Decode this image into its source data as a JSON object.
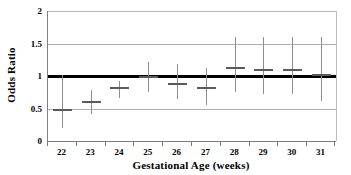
{
  "chart_data": {
    "type": "scatter",
    "title": "",
    "xlabel": "Gestational Age (weeks)",
    "ylabel": "Odds Ratio",
    "categories": [
      "22",
      "23",
      "24",
      "25",
      "26",
      "27",
      "28",
      "29",
      "30",
      "31"
    ],
    "x": [
      22,
      23,
      24,
      25,
      26,
      27,
      28,
      29,
      30,
      31
    ],
    "values": [
      0.48,
      0.6,
      0.81,
      0.98,
      0.88,
      0.82,
      1.12,
      1.09,
      1.09,
      1.01
    ],
    "ci_lower": [
      0.2,
      0.42,
      0.66,
      0.75,
      0.65,
      0.55,
      0.75,
      0.72,
      0.72,
      0.62
    ],
    "ci_upper": [
      1.01,
      0.78,
      0.93,
      1.22,
      1.18,
      1.12,
      1.6,
      1.6,
      1.6,
      1.6
    ],
    "series": [
      {
        "name": "Odds Ratio",
        "values": [
          0.48,
          0.6,
          0.81,
          0.98,
          0.88,
          0.82,
          1.12,
          1.09,
          1.09,
          1.01
        ]
      }
    ],
    "reference_line": 1.0,
    "ylim": [
      0,
      2
    ],
    "yticks": [
      0,
      0.5,
      1,
      1.5,
      2
    ],
    "ytick_labels": [
      "0",
      "0.5",
      "1",
      "1.5",
      "2"
    ],
    "grid": true,
    "grid_axis": "y",
    "legend": false,
    "legend_position": "none",
    "colors": {
      "marker": "#5a5a5a",
      "whisker": "#8d8d8d",
      "gridline": "#b0b0b0",
      "reference_line": "#000000",
      "axis": "#7a7a7a",
      "background": "#ffffff"
    }
  }
}
